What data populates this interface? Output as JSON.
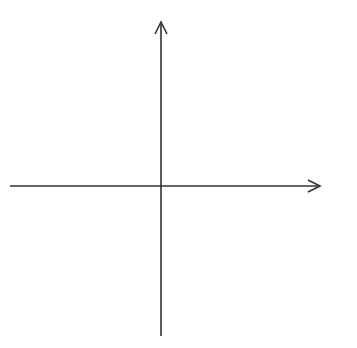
{
  "chart_data": {
    "type": "coordinate-grid",
    "title": "",
    "xlabel": "x",
    "ylabel": "y",
    "xlim": [
      -6,
      6
    ],
    "ylim": [
      -6,
      6
    ],
    "grid": true,
    "grid_style": "dotted",
    "x_tick_labels": [
      "−5",
      "−4",
      "−3",
      "−2",
      "−1",
      "1",
      "2",
      "3",
      "4",
      "5"
    ],
    "y_tick_labels": [
      "5",
      "4",
      "3",
      "2",
      "1",
      "−1",
      "−2",
      "−3",
      "−4",
      "−5"
    ],
    "x_ticks": [
      -5,
      -4,
      -3,
      -2,
      -1,
      1,
      2,
      3,
      4,
      5
    ],
    "y_ticks": [
      5,
      4,
      3,
      2,
      1,
      -1,
      -2,
      -3,
      -4,
      -5
    ],
    "series": []
  },
  "colors": {
    "axis": "#333333",
    "grid": "#b8b8b8",
    "background": "#ffffff"
  }
}
